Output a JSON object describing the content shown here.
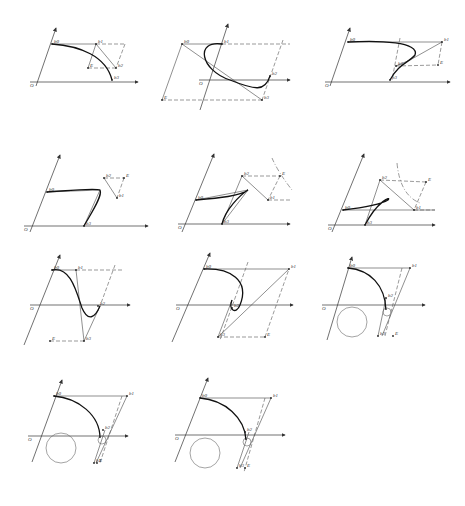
{
  "figure": {
    "rows": 4,
    "cols": 3,
    "panel_count": 11
  },
  "panels": [
    {
      "id": 1,
      "origin_label": "O",
      "labels": {
        "b0": "b0",
        "b1": "b1",
        "b2": "b2",
        "b3": "b3",
        "E": "E"
      },
      "axes": {
        "origin": [
          38,
          82
        ],
        "x_end": [
          138,
          82
        ],
        "y_start": [
          36,
          86
        ],
        "y_end": [
          56,
          28
        ]
      },
      "points": {
        "b0": [
          52,
          44
        ],
        "b1": [
          96,
          44
        ],
        "b2": [
          116,
          68
        ],
        "b3": [
          112,
          80
        ],
        "E": [
          88,
          68
        ],
        "corner": [
          125,
          44
        ]
      },
      "curve": "M52 44 C80 46 106 56 112 80",
      "solid": [
        [
          96,
          44,
          116,
          68
        ],
        [
          52,
          44,
          96,
          44
        ],
        [
          96,
          44,
          88,
          68
        ]
      ],
      "dashed": [
        [
          96,
          44,
          125,
          44
        ],
        [
          125,
          44,
          116,
          68
        ],
        [
          88,
          68,
          116,
          68
        ]
      ]
    },
    {
      "id": 2,
      "origin_label": "O",
      "labels": {
        "b0": "b0",
        "b1": "b1",
        "b2": "b2",
        "b3": "b3",
        "E": "E"
      },
      "axes": {
        "origin": [
          207,
          80
        ],
        "x_end": [
          290,
          80
        ],
        "y_start": [
          200,
          110
        ],
        "y_end": [
          228,
          24
        ]
      },
      "points": {
        "b0": [
          182,
          44
        ],
        "b1": [
          222,
          44
        ],
        "b2": [
          270,
          76
        ],
        "b3": [
          262,
          100
        ],
        "E": [
          162,
          100
        ]
      },
      "curve": "M222 44 C195 40 200 70 230 80 C255 90 265 92 270 76",
      "solid": [
        [
          182,
          44,
          222,
          44
        ],
        [
          182,
          44,
          262,
          100
        ],
        [
          182,
          44,
          162,
          100
        ]
      ],
      "dashed": [
        [
          222,
          44,
          290,
          44
        ],
        [
          162,
          100,
          262,
          100
        ],
        [
          283,
          40,
          262,
          100
        ]
      ]
    },
    {
      "id": 3,
      "origin_label": "O",
      "labels": {
        "b0": "b0",
        "b1": "b1",
        "b2": "b2",
        "b3": "b3",
        "E": "E"
      },
      "axes": {
        "origin": [
          333,
          82
        ],
        "x_end": [
          450,
          82
        ],
        "y_start": [
          330,
          86
        ],
        "y_end": [
          350,
          28
        ]
      },
      "points": {
        "b0": [
          348,
          42
        ],
        "b1": [
          442,
          42
        ],
        "b2": [
          396,
          66
        ],
        "b3": [
          390,
          80
        ],
        "E": [
          438,
          65
        ]
      },
      "curve": "M348 42 C380 40 420 42 415 55 C410 62 398 64 390 80",
      "solid": [
        [
          348,
          42,
          442,
          42
        ],
        [
          442,
          42,
          410,
          60
        ],
        [
          396,
          66,
          410,
          60
        ]
      ],
      "dashed": [
        [
          442,
          42,
          438,
          65
        ],
        [
          396,
          66,
          438,
          65
        ],
        [
          400,
          38,
          392,
          80
        ]
      ]
    },
    {
      "id": 4,
      "origin_label": "O",
      "labels": {
        "b0": "b0",
        "b1": "b1",
        "b2": "b2",
        "b3": "b3",
        "E": "E"
      },
      "axes": {
        "origin": [
          32,
          226
        ],
        "x_end": [
          148,
          226
        ],
        "y_start": [
          30,
          232
        ],
        "y_end": [
          60,
          155
        ]
      },
      "points": {
        "b0": [
          47,
          192
        ],
        "b1": [
          117,
          198
        ],
        "b2": [
          104,
          178
        ],
        "b3": [
          84,
          226
        ],
        "E": [
          124,
          178
        ]
      },
      "curve": "M47 192 C75 190 95 188 100 190 C103 196 90 215 84 226",
      "solid": [
        [
          104,
          178,
          117,
          198
        ],
        [
          47,
          192,
          100,
          190
        ],
        [
          100,
          190,
          84,
          226
        ]
      ],
      "dashed": [
        [
          104,
          178,
          124,
          178
        ],
        [
          124,
          178,
          117,
          198
        ]
      ]
    },
    {
      "id": 5,
      "origin_label": "O",
      "labels": {
        "b0": "b0",
        "b1": "b1",
        "b2": "b2",
        "b3": "b3",
        "E": "E",
        "C": "C"
      },
      "axes": {
        "origin": [
          186,
          224
        ],
        "x_end": [
          290,
          224
        ],
        "y_start": [
          182,
          232
        ],
        "y_end": [
          214,
          154
        ]
      },
      "points": {
        "b0": [
          196,
          200
        ],
        "b1": [
          268,
          200
        ],
        "b2": [
          242,
          176
        ],
        "b3": [
          222,
          224
        ],
        "E": [
          280,
          176
        ]
      },
      "curve": "M196 200 C220 198 240 196 248 190 C240 195 225 210 222 224",
      "solid": [
        [
          242,
          176,
          268,
          200
        ],
        [
          196,
          200,
          248,
          190
        ],
        [
          248,
          190,
          222,
          224
        ],
        [
          242,
          176,
          222,
          224
        ]
      ],
      "dashed": [
        [
          242,
          176,
          280,
          176
        ],
        [
          280,
          176,
          268,
          200
        ],
        [
          268,
          200,
          290,
          200
        ]
      ],
      "dashdot": [
        "M272 158 Q278 172 292 190"
      ]
    },
    {
      "id": 6,
      "origin_label": "O",
      "labels": {
        "b0": "b0",
        "b1": "b1",
        "b2": "b2",
        "b3": "b3",
        "E": "E",
        "C": "C"
      },
      "axes": {
        "origin": [
          336,
          225
        ],
        "x_end": [
          435,
          225
        ],
        "y_start": [
          332,
          232
        ],
        "y_end": [
          364,
          154
        ]
      },
      "points": {
        "b0": [
          343,
          210
        ],
        "b1": [
          414,
          210
        ],
        "b2": [
          380,
          180
        ],
        "b3": [
          365,
          225
        ],
        "E": [
          426,
          182
        ]
      },
      "curve": "M343 210 C360 208 380 205 388 200 C392 196 378 200 365 225",
      "solid": [
        [
          380,
          180,
          414,
          210
        ],
        [
          343,
          210,
          435,
          210
        ],
        [
          380,
          180,
          365,
          225
        ]
      ],
      "dashed": [
        [
          380,
          180,
          426,
          182
        ],
        [
          426,
          182,
          414,
          210
        ],
        [
          414,
          210,
          435,
          210
        ]
      ],
      "dashdot": [
        "M397 163 Q400 195 420 203"
      ]
    },
    {
      "id": 7,
      "origin_label": "O",
      "labels": {
        "b0": "b0",
        "b1": "b1",
        "b2": "b2",
        "b3": "b3",
        "E": "E"
      },
      "axes": {
        "origin": [
          38,
          305
        ],
        "x_end": [
          130,
          305
        ],
        "y_start": [
          24,
          345
        ],
        "y_end": [
          60,
          255
        ]
      },
      "points": {
        "b0": [
          52,
          270
        ],
        "b1": [
          76,
          270
        ],
        "b2": [
          98,
          306
        ],
        "b3": [
          84,
          341
        ],
        "E": [
          50,
          341
        ]
      },
      "curve": "M52 270 C70 266 76 290 82 308 C88 322 95 318 100 306",
      "solid": [
        [
          52,
          270,
          76,
          270
        ],
        [
          76,
          270,
          84,
          341
        ],
        [
          84,
          341,
          100,
          306
        ]
      ],
      "dashed": [
        [
          76,
          270,
          124,
          270
        ],
        [
          50,
          341,
          84,
          341
        ],
        [
          115,
          265,
          100,
          306
        ]
      ]
    },
    {
      "id": 8,
      "origin_label": "O",
      "labels": {
        "b0": "b0",
        "b1": "b1",
        "b2": "b2",
        "b3": "b3",
        "E": "E",
        "C": "C"
      },
      "axes": {
        "origin": [
          184,
          305
        ],
        "x_end": [
          293,
          305
        ],
        "y_start": [
          172,
          342
        ],
        "y_end": [
          210,
          253
        ]
      },
      "points": {
        "b0": [
          204,
          269
        ],
        "b1": [
          289,
          269
        ],
        "b2": [
          232,
          308
        ],
        "b3": [
          218,
          337
        ],
        "E": [
          265,
          337
        ]
      },
      "curve": "M204 269 C230 268 250 280 240 305 C236 315 228 310 232 300",
      "solid": [
        [
          204,
          269,
          289,
          269
        ],
        [
          289,
          269,
          218,
          337
        ],
        [
          232,
          300,
          218,
          337
        ]
      ],
      "dashed": [
        [
          218,
          337,
          265,
          337
        ],
        [
          265,
          337,
          289,
          269
        ],
        [
          248,
          262,
          220,
          340
        ]
      ]
    },
    {
      "id": 9,
      "origin_label": "O",
      "labels": {
        "b0": "b0",
        "b1": "b1",
        "b2": "b2",
        "b3": "b3",
        "E": "E",
        "C": "C"
      },
      "axes": {
        "origin": [
          330,
          305
        ],
        "x_end": [
          425,
          305
        ],
        "y_start": [
          327,
          340
        ],
        "y_end": [
          352,
          257
        ]
      },
      "points": {
        "b0": [
          348,
          268
        ],
        "b1": [
          410,
          268
        ],
        "b2": [
          386,
          298
        ],
        "b3": [
          378,
          336
        ],
        "E": [
          393,
          336
        ]
      },
      "curve": "M348 268 C370 270 385 285 386 310",
      "solid": [
        [
          348,
          268,
          410,
          268
        ],
        [
          410,
          268,
          382,
          336
        ],
        [
          386,
          298,
          378,
          336
        ]
      ],
      "dashed": [
        [
          402,
          268,
          385,
          336
        ]
      ],
      "circles": [
        {
          "cx": 352,
          "cy": 322,
          "r": 15
        },
        {
          "cx": 387,
          "cy": 312,
          "r": 4
        }
      ]
    },
    {
      "id": 10,
      "origin_label": "O",
      "labels": {
        "b0": "b0",
        "b1": "b1",
        "b2": "b2",
        "b3": "b3",
        "E": "E",
        "C": "C"
      },
      "axes": {
        "origin": [
          36,
          436
        ],
        "x_end": [
          128,
          436
        ],
        "y_start": [
          32,
          462
        ],
        "y_end": [
          62,
          380
        ]
      },
      "points": {
        "b0": [
          54,
          396
        ],
        "b1": [
          127,
          396
        ],
        "b2": [
          103,
          430
        ],
        "b3": [
          94,
          463
        ],
        "E": [
          97,
          463
        ]
      },
      "curve": "M54 396 C78 398 100 415 100 438",
      "solid": [
        [
          54,
          396,
          127,
          396
        ],
        [
          127,
          396,
          96,
          463
        ],
        [
          105,
          430,
          94,
          463
        ]
      ],
      "dashed": [
        [
          122,
          396,
          100,
          463
        ]
      ],
      "circles": [
        {
          "cx": 61,
          "cy": 448,
          "r": 15
        },
        {
          "cx": 102,
          "cy": 440,
          "r": 4
        }
      ]
    },
    {
      "id": 11,
      "origin_label": "O",
      "labels": {
        "b0": "b0",
        "b1": "b1",
        "b2": "b2",
        "b3": "b3",
        "E": "E",
        "C": "C"
      },
      "axes": {
        "origin": [
          183,
          435
        ],
        "x_end": [
          285,
          435
        ],
        "y_start": [
          175,
          462
        ],
        "y_end": [
          208,
          378
        ]
      },
      "points": {
        "b0": [
          200,
          398
        ],
        "b1": [
          271,
          398
        ],
        "b2": [
          245,
          432
        ],
        "b3": [
          237,
          468
        ],
        "E": [
          245,
          468
        ]
      },
      "curve": "M200 398 C225 400 245 418 246 440",
      "solid": [
        [
          200,
          398,
          271,
          398
        ],
        [
          271,
          398,
          240,
          468
        ],
        [
          249,
          432,
          237,
          468
        ]
      ],
      "dashed": [
        [
          265,
          398,
          244,
          472
        ]
      ],
      "circles": [
        {
          "cx": 205,
          "cy": 453,
          "r": 15
        },
        {
          "cx": 247,
          "cy": 442,
          "r": 4
        }
      ]
    }
  ]
}
